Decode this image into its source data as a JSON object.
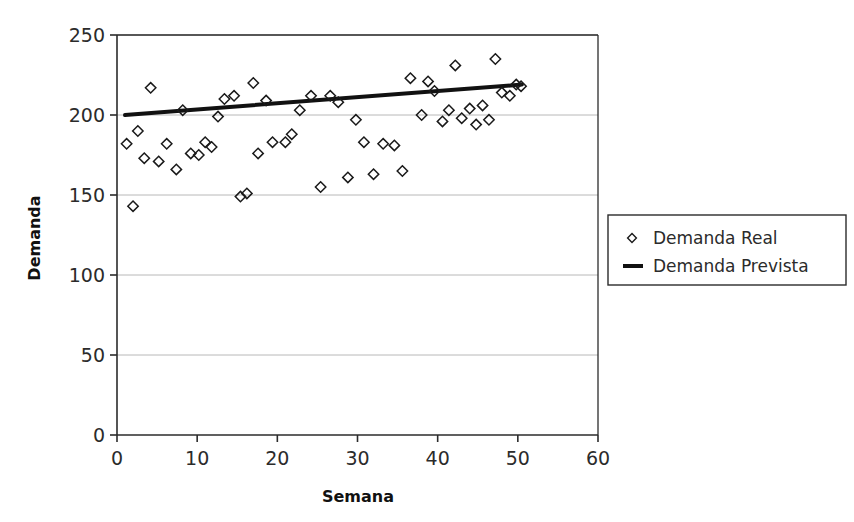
{
  "chart_data": {
    "type": "scatter",
    "title": "",
    "xlabel": "Semana",
    "ylabel": "Demanda",
    "xlim": [
      0,
      60
    ],
    "ylim": [
      0,
      250
    ],
    "xticks": [
      0,
      10,
      20,
      30,
      40,
      50,
      60
    ],
    "yticks": [
      0,
      50,
      100,
      150,
      200,
      250
    ],
    "grid": "horizontal",
    "legend_position": "right",
    "series": [
      {
        "name": "Demanda Real",
        "marker": "diamond-open",
        "color": "#1a1a1a",
        "x": [
          1.2,
          2.0,
          2.6,
          3.4,
          4.2,
          5.2,
          6.2,
          7.4,
          8.2,
          9.2,
          10.2,
          11.0,
          11.8,
          12.6,
          13.4,
          14.6,
          15.4,
          16.2,
          17.0,
          17.6,
          18.6,
          19.4,
          21.0,
          21.8,
          22.8,
          24.2,
          25.4,
          26.6,
          27.6,
          28.8,
          29.8,
          30.8,
          32.0,
          33.2,
          34.6,
          35.6,
          36.6,
          38.0,
          38.8,
          39.6,
          40.6,
          41.4,
          42.2,
          43.0,
          44.0,
          44.8,
          45.6,
          46.4,
          47.2,
          48.0,
          49.0,
          49.8,
          50.4
        ],
        "y": [
          182,
          143,
          190,
          173,
          217,
          171,
          182,
          166,
          203,
          176,
          175,
          183,
          180,
          199,
          210,
          212,
          149,
          151,
          220,
          176,
          209,
          183,
          183,
          188,
          203,
          212,
          155,
          212,
          208,
          161,
          197,
          183,
          163,
          182,
          181,
          165,
          223,
          200,
          221,
          215,
          196,
          203,
          231,
          198,
          204,
          194,
          206,
          197,
          235,
          214,
          212,
          219,
          218
        ]
      },
      {
        "name": "Demanda Prevista",
        "marker": "line",
        "color": "#111111",
        "x": [
          1.0,
          50.5
        ],
        "y": [
          200.0,
          219.0
        ],
        "description": "linear trend line"
      }
    ]
  },
  "legend": {
    "items": [
      {
        "label": "Demanda Real",
        "symbol": "diamond"
      },
      {
        "label": "Demanda Prevista",
        "symbol": "line"
      }
    ]
  },
  "axes": {
    "x": {
      "title": "Semana",
      "labels": [
        "0",
        "10",
        "20",
        "30",
        "40",
        "50",
        "60"
      ]
    },
    "y": {
      "title": "Demanda",
      "labels": [
        "0",
        "50",
        "100",
        "150",
        "200",
        "250"
      ]
    }
  },
  "colors": {
    "background": "#ffffff",
    "axis": "#2b2b2b",
    "grid": "#b8b8b8",
    "marker": "#1a1a1a",
    "trend": "#111111"
  }
}
